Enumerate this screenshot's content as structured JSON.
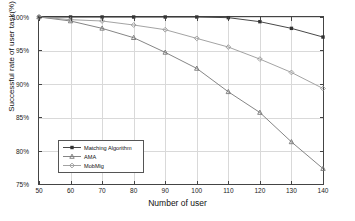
{
  "chart_data": {
    "type": "line",
    "title": "",
    "xlabel": "Number of user",
    "ylabel": "Successful rate of user task(%)",
    "x": [
      50,
      60,
      70,
      80,
      90,
      100,
      110,
      120,
      130,
      140
    ],
    "xlim": [
      50,
      140
    ],
    "ylim": [
      75,
      100
    ],
    "xticks": [
      "50",
      "60",
      "70",
      "80",
      "90",
      "100",
      "110",
      "120",
      "130",
      "140"
    ],
    "yticks": [
      "75%",
      "80%",
      "85%",
      "90%",
      "95%",
      "100%"
    ],
    "grid": true,
    "legend_position": "lower left",
    "series": [
      {
        "name": "Matching Algorithm",
        "marker": "square",
        "color": "#333333",
        "values": [
          100,
          100,
          100,
          100,
          100,
          100,
          99.9,
          99.3,
          98.3,
          97.0
        ]
      },
      {
        "name": "AMA",
        "marker": "triangle",
        "color": "#777777",
        "values": [
          100,
          99.4,
          98.3,
          96.9,
          94.7,
          92.3,
          88.8,
          85.7,
          81.3,
          77.3
        ]
      },
      {
        "name": "MobMig",
        "marker": "diamond",
        "color": "#999999",
        "values": [
          100,
          99.6,
          99.4,
          98.8,
          98.1,
          96.8,
          95.5,
          93.7,
          91.7,
          89.3
        ]
      }
    ]
  },
  "axes": {
    "x_axis_label": "Number of user",
    "y_axis_label": "Successful rate of user task(%)"
  }
}
